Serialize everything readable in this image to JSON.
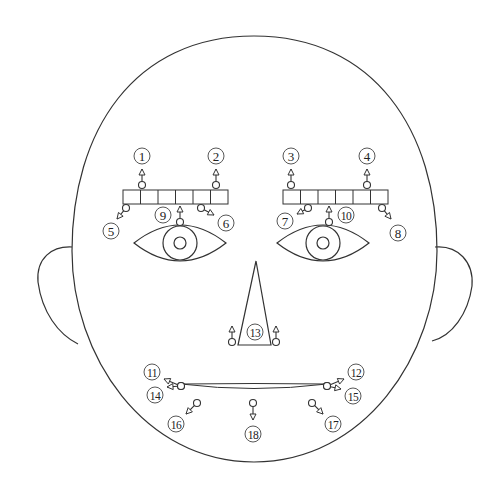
{
  "diagram": {
    "colors": {
      "stroke": "#333333",
      "background": "#ffffff"
    },
    "head": {
      "cx": 254,
      "top": 36,
      "bottom": 462,
      "left": 72,
      "right": 437
    },
    "ears": [
      {
        "side": "left",
        "path": "M 72 247 C 52 246 36 258 38 282 C 42 312 58 334 78 344"
      },
      {
        "side": "right",
        "path": "M 435 247 C 458 245 474 262 472 286 C 468 314 452 336 432 341"
      }
    ],
    "eyebrows": [
      {
        "side": "left",
        "x": 123,
        "y": 190,
        "cell_w": 17.5,
        "h": 14,
        "cells": 6
      },
      {
        "side": "right",
        "x": 283,
        "y": 190,
        "cell_w": 17.5,
        "h": 14,
        "cells": 6
      }
    ],
    "eyes": [
      {
        "side": "left",
        "cx": 180,
        "cy": 243,
        "rx": 46,
        "ry": 18,
        "iris_r": 17,
        "pupil_r": 6
      },
      {
        "side": "right",
        "cx": 323,
        "cy": 243,
        "rx": 46,
        "ry": 18,
        "iris_r": 17,
        "pupil_r": 6
      }
    ],
    "nose": {
      "apex": [
        256,
        261
      ],
      "base_left": [
        238,
        345
      ],
      "base_right": [
        271,
        345
      ]
    },
    "mouth": {
      "left": [
        181,
        384
      ],
      "right": [
        327,
        384
      ],
      "upper_ctrl": 383,
      "lower_ctrl": 393
    },
    "points": [
      {
        "id": "1",
        "label": "①",
        "marker": [
          142,
          185
        ],
        "tip": [
          142,
          169
        ],
        "label_pos": [
          142,
          156
        ]
      },
      {
        "id": "2",
        "label": "②",
        "marker": [
          216,
          185
        ],
        "tip": [
          216,
          169
        ],
        "label_pos": [
          216,
          156
        ]
      },
      {
        "id": "3",
        "label": "③",
        "marker": [
          291,
          185
        ],
        "tip": [
          291,
          169
        ],
        "label_pos": [
          291,
          156
        ]
      },
      {
        "id": "4",
        "label": "④",
        "marker": [
          367,
          185
        ],
        "tip": [
          367,
          169
        ],
        "label_pos": [
          367,
          156
        ]
      },
      {
        "id": "5",
        "label": "⑤",
        "marker": [
          126,
          208
        ],
        "tip": [
          117,
          219
        ],
        "label_pos": [
          111,
          231
        ]
      },
      {
        "id": "6",
        "label": "⑥",
        "marker": [
          201,
          208
        ],
        "tip": [
          214,
          215
        ],
        "label_pos": [
          226,
          223
        ]
      },
      {
        "id": "7",
        "label": "⑦",
        "marker": [
          308,
          208
        ],
        "tip": [
          297,
          214
        ],
        "label_pos": [
          285,
          221
        ]
      },
      {
        "id": "8",
        "label": "⑧",
        "marker": [
          382,
          208
        ],
        "tip": [
          391,
          219
        ],
        "label_pos": [
          398,
          233
        ]
      },
      {
        "id": "9",
        "label": "⑨",
        "marker": [
          180,
          222
        ],
        "tip": [
          180,
          206
        ],
        "label_pos": [
          163,
          215
        ]
      },
      {
        "id": "10",
        "label": "⑩",
        "marker": [
          329,
          222
        ],
        "tip": [
          329,
          206
        ],
        "label_pos": [
          346,
          215
        ]
      },
      {
        "id": "13a",
        "label": "",
        "marker": [
          232,
          342
        ],
        "tip": [
          232,
          326
        ],
        "label_pos": null
      },
      {
        "id": "13b",
        "label": "",
        "marker": [
          276,
          342
        ],
        "tip": [
          276,
          326
        ],
        "label_pos": null
      },
      {
        "id": "11",
        "label": "⑪",
        "marker": [
          181,
          386
        ],
        "tip": [
          164,
          379
        ],
        "label_pos": [
          152,
          372
        ]
      },
      {
        "id": "14",
        "label": "⑭",
        "marker": [
          181,
          386
        ],
        "tip": [
          167,
          387
        ],
        "label_pos": [
          155,
          395
        ]
      },
      {
        "id": "12",
        "label": "⑫",
        "marker": [
          327,
          386
        ],
        "tip": [
          344,
          379
        ],
        "label_pos": [
          356,
          372
        ]
      },
      {
        "id": "15",
        "label": "⑮",
        "marker": [
          327,
          386
        ],
        "tip": [
          341,
          389
        ],
        "label_pos": [
          353,
          396
        ]
      },
      {
        "id": "16",
        "label": "⑯",
        "marker": [
          197,
          403
        ],
        "tip": [
          186,
          414
        ],
        "label_pos": [
          176,
          424
        ]
      },
      {
        "id": "17",
        "label": "⑰",
        "marker": [
          312,
          403
        ],
        "tip": [
          323,
          414
        ],
        "label_pos": [
          333,
          424
        ]
      },
      {
        "id": "18",
        "label": "⑱",
        "marker": [
          253,
          403
        ],
        "tip": [
          253,
          420
        ],
        "label_pos": [
          253,
          434
        ]
      }
    ],
    "nose_label": {
      "label": "⑬",
      "pos": [
        255,
        332
      ]
    },
    "label_texts": {
      "1": "1",
      "2": "2",
      "3": "3",
      "4": "4",
      "5": "5",
      "6": "6",
      "7": "7",
      "8": "8",
      "9": "9",
      "10": "10",
      "11": "11",
      "12": "12",
      "13": "13",
      "14": "14",
      "15": "15",
      "16": "16",
      "17": "17",
      "18": "18"
    }
  }
}
